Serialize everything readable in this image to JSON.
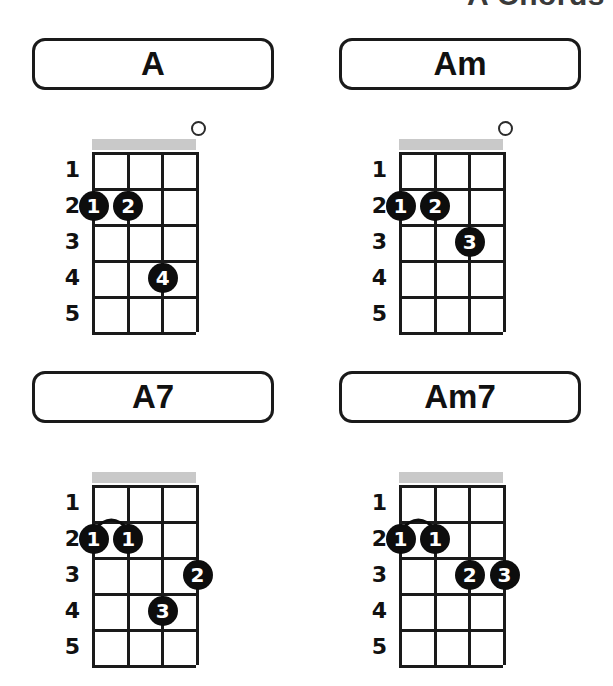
{
  "page": {
    "title": "A Chords",
    "accent_color": "#0d0d0d",
    "nut_color": "#c9c9c9",
    "background": "#ffffff"
  },
  "fretboard": {
    "string_count": 4,
    "fret_count": 5,
    "fret_labels": [
      "1",
      "2",
      "3",
      "4",
      "5"
    ]
  },
  "chords": [
    {
      "name": "A",
      "open_strings": [
        4
      ],
      "barres": [],
      "dots": [
        {
          "string": 1,
          "fret": 2,
          "finger": "1"
        },
        {
          "string": 2,
          "fret": 2,
          "finger": "2"
        },
        {
          "string": 3,
          "fret": 4,
          "finger": "4"
        }
      ]
    },
    {
      "name": "Am",
      "open_strings": [
        4
      ],
      "barres": [],
      "dots": [
        {
          "string": 1,
          "fret": 2,
          "finger": "1"
        },
        {
          "string": 2,
          "fret": 2,
          "finger": "2"
        },
        {
          "string": 3,
          "fret": 3,
          "finger": "3"
        }
      ]
    },
    {
      "name": "A7",
      "open_strings": [],
      "barres": [
        {
          "fret": 2,
          "from_string": 1,
          "to_string": 2
        }
      ],
      "dots": [
        {
          "string": 1,
          "fret": 2,
          "finger": "1"
        },
        {
          "string": 2,
          "fret": 2,
          "finger": "1"
        },
        {
          "string": 4,
          "fret": 3,
          "finger": "2"
        },
        {
          "string": 3,
          "fret": 4,
          "finger": "3"
        }
      ]
    },
    {
      "name": "Am7",
      "open_strings": [],
      "barres": [
        {
          "fret": 2,
          "from_string": 1,
          "to_string": 2
        }
      ],
      "dots": [
        {
          "string": 1,
          "fret": 2,
          "finger": "1"
        },
        {
          "string": 2,
          "fret": 2,
          "finger": "1"
        },
        {
          "string": 3,
          "fret": 3,
          "finger": "2"
        },
        {
          "string": 4,
          "fret": 3,
          "finger": "3"
        }
      ]
    }
  ]
}
